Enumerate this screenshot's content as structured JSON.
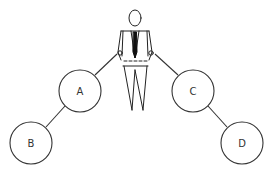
{
  "diagram": {
    "header_fragment": "",
    "figure": "businessman",
    "nodes": [
      {
        "id": "A",
        "label": "A",
        "cx": 80,
        "cy": 91,
        "r": 21
      },
      {
        "id": "B",
        "label": "B",
        "cx": 31,
        "cy": 143,
        "r": 21
      },
      {
        "id": "C",
        "label": "C",
        "cx": 193,
        "cy": 91,
        "r": 21
      },
      {
        "id": "D",
        "label": "D",
        "cx": 242,
        "cy": 143,
        "r": 21
      }
    ],
    "edges": [
      {
        "from": "figure-left-hand",
        "to": "A"
      },
      {
        "from": "A",
        "to": "B"
      },
      {
        "from": "figure-right-hand",
        "to": "C"
      },
      {
        "from": "C",
        "to": "D"
      }
    ],
    "colors": {
      "stroke": "#333333",
      "background": "#ffffff"
    }
  }
}
